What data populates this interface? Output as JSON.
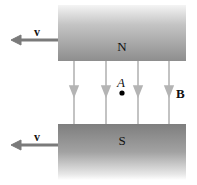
{
  "diagram": {
    "north_pole": {
      "label": "N"
    },
    "south_pole": {
      "label": "S"
    },
    "velocity_top": {
      "label": "v"
    },
    "velocity_bottom": {
      "label": "v"
    },
    "field": {
      "label": "B",
      "line_count": 4
    },
    "point": {
      "label": "A"
    }
  },
  "colors": {
    "field_line": "#b4b4b4",
    "velocity_arrow": "#7a7a7a",
    "text": "#111111"
  }
}
